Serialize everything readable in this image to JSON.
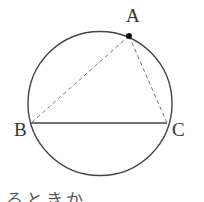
{
  "diagram": {
    "type": "circle-inscribed-triangle",
    "circle": {
      "cx": 100,
      "cy": 103.5,
      "r": 72,
      "stroke": "#444444"
    },
    "points": [
      {
        "id": "A",
        "label": "A",
        "x": 129,
        "y": 36,
        "marked": true,
        "label_x": 126,
        "label_y": 22
      },
      {
        "id": "B",
        "label": "B",
        "x": 31,
        "y": 123,
        "marked": false,
        "label_x": 14,
        "label_y": 136
      },
      {
        "id": "C",
        "label": "C",
        "x": 167,
        "y": 123,
        "marked": false,
        "label_x": 172,
        "label_y": 136
      }
    ],
    "segments": [
      {
        "from": "B",
        "to": "C",
        "style": "solid"
      },
      {
        "from": "A",
        "to": "B",
        "style": "dashed"
      },
      {
        "from": "A",
        "to": "C",
        "style": "dashed"
      }
    ]
  },
  "caption_fragment": "るときか"
}
